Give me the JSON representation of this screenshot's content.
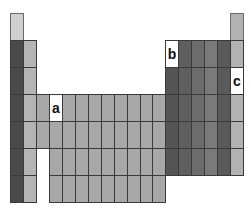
{
  "grid": {
    "origin_x": 10,
    "origin_y": 13,
    "col_width": 12.95,
    "row_height": 27,
    "columns": 18,
    "rows": 7
  },
  "colors": {
    "hydrogen": "#cfcfcf",
    "group1": "#4a4a4a",
    "group2": "#b4b4b4",
    "transition": "#a8a8a8",
    "group13": "#545454",
    "group14": "#5f5f5f",
    "group15": "#6c6c6c",
    "group16": "#7a7a7a",
    "group17": "#5a5a5a",
    "group18": "#b2b2b2",
    "highlight": "#ffffff"
  },
  "labels": {
    "a": "a",
    "b": "b",
    "c": "c"
  },
  "marked_cells": [
    {
      "label": "a",
      "row": 4,
      "col": 4
    },
    {
      "label": "b",
      "row": 2,
      "col": 13
    },
    {
      "label": "c",
      "row": 3,
      "col": 18
    }
  ]
}
